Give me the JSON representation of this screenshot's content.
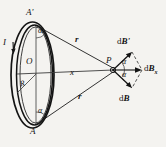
{
  "figure": {
    "background_color": "#f4f3f0",
    "ink_color": "#141414",
    "labels": {
      "top_point": "A'",
      "bottom_point": "A",
      "center": "O",
      "radius": "R",
      "current": "I",
      "field_point": "P",
      "axis_distance": "x",
      "r_upper": "r",
      "r_lower": "r",
      "angle_top": "α",
      "angle_bottom": "α",
      "angle_upper_vector": "α",
      "angle_lower_vector": "α",
      "dB_upper_prefix": "d",
      "dB_upper": "B'",
      "dB_lower_prefix": "d",
      "dB_lower": "B",
      "dBx_prefix": "d",
      "dBx_symbol": "B",
      "dBx_subscript": "x"
    }
  }
}
